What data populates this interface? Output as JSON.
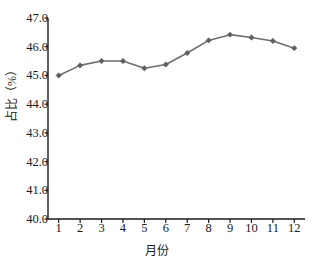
{
  "chart_data": {
    "type": "line",
    "title": "",
    "subtitle": "",
    "xlabel": "月份",
    "ylabel": "占比（%）",
    "categories": [
      "1",
      "2",
      "3",
      "4",
      "5",
      "6",
      "7",
      "8",
      "9",
      "10",
      "11",
      "12"
    ],
    "x": [
      1,
      2,
      3,
      4,
      5,
      6,
      7,
      8,
      9,
      10,
      11,
      12
    ],
    "values": [
      45.0,
      45.35,
      45.5,
      45.5,
      45.25,
      45.38,
      45.78,
      46.22,
      46.42,
      46.32,
      46.2,
      45.95
    ],
    "series": [
      {
        "name": "占比",
        "values": [
          45.0,
          45.35,
          45.5,
          45.5,
          45.25,
          45.38,
          45.78,
          46.22,
          46.42,
          46.32,
          46.2,
          45.95
        ]
      }
    ],
    "ylim": [
      40.0,
      47.0
    ],
    "xlim": [
      0.5,
      12.5
    ],
    "ytick_labels": [
      "40.0",
      "41.0",
      "42.0",
      "43.0",
      "44.0",
      "45.0",
      "46.0",
      "47.0"
    ],
    "yticks": [
      40.0,
      41.0,
      42.0,
      43.0,
      44.0,
      45.0,
      46.0,
      47.0
    ],
    "xtick_labels": [
      "1",
      "2",
      "3",
      "4",
      "5",
      "6",
      "7",
      "8",
      "9",
      "10",
      "11",
      "12"
    ],
    "grid": false,
    "legend": "none",
    "line_color": "#6e6e6e",
    "marker_color": "#5f5f5f",
    "marker_shape": "diamond",
    "axis_color": "#1a1a1a",
    "background": "#ffffff"
  }
}
